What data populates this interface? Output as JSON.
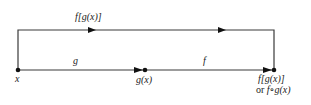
{
  "diagram": {
    "nodes": [
      {
        "id": "x",
        "label": "x"
      },
      {
        "id": "gx",
        "label": "g(x)"
      },
      {
        "id": "fgx",
        "label": "f[g(x)]",
        "sublabel_prefix": "or ",
        "sublabel": "f∘g(x)"
      }
    ],
    "edges": [
      {
        "from": "x",
        "to": "gx",
        "label": "g"
      },
      {
        "from": "gx",
        "to": "fgx",
        "label": "f"
      },
      {
        "from": "x",
        "to": "fgx",
        "label": "f[g(x)]",
        "route": "top"
      }
    ]
  },
  "colors": {
    "line": "#3a3a3a",
    "text": "#222222"
  }
}
